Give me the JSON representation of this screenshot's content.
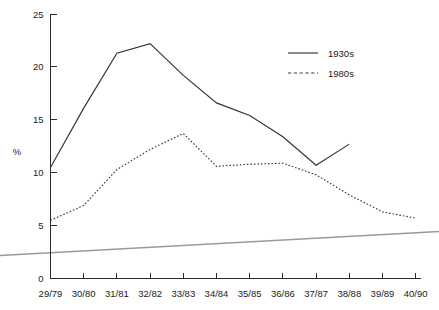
{
  "chart_data": {
    "type": "line",
    "title": "",
    "subtitle": "",
    "xlabel": "",
    "ylabel": "%",
    "ylim": [
      0,
      25
    ],
    "yticks": [
      0,
      5,
      10,
      15,
      20,
      25
    ],
    "ytick_labels": [
      "0",
      "5",
      "10",
      "15",
      "20",
      "25"
    ],
    "grid": false,
    "legend_position": "top-right",
    "categories": [
      "29/79",
      "30/80",
      "31/81",
      "32/82",
      "33/83",
      "34/84",
      "35/85",
      "36/86",
      "37/87",
      "38/88",
      "39/89",
      "40/90"
    ],
    "series": [
      {
        "name": "1930s",
        "style": "solid",
        "color": "#333333",
        "values": [
          10.5,
          16.1,
          21.3,
          22.2,
          19.2,
          16.6,
          15.4,
          13.4,
          10.7,
          12.7,
          null,
          null
        ]
      },
      {
        "name": "1980s",
        "style": "dashed",
        "color": "#3a3a3a",
        "values": [
          5.5,
          6.9,
          10.3,
          12.2,
          13.7,
          10.6,
          10.8,
          10.9,
          9.8,
          7.9,
          6.3,
          5.7
        ]
      }
    ],
    "annotations": []
  },
  "legend": {
    "items": [
      {
        "label": "1930s",
        "style": "solid"
      },
      {
        "label": "1980s",
        "style": "dashed"
      }
    ]
  },
  "artifacts": {
    "scan_line": {
      "name": "scan-artifact-line",
      "color": "#9a9a9a"
    }
  }
}
